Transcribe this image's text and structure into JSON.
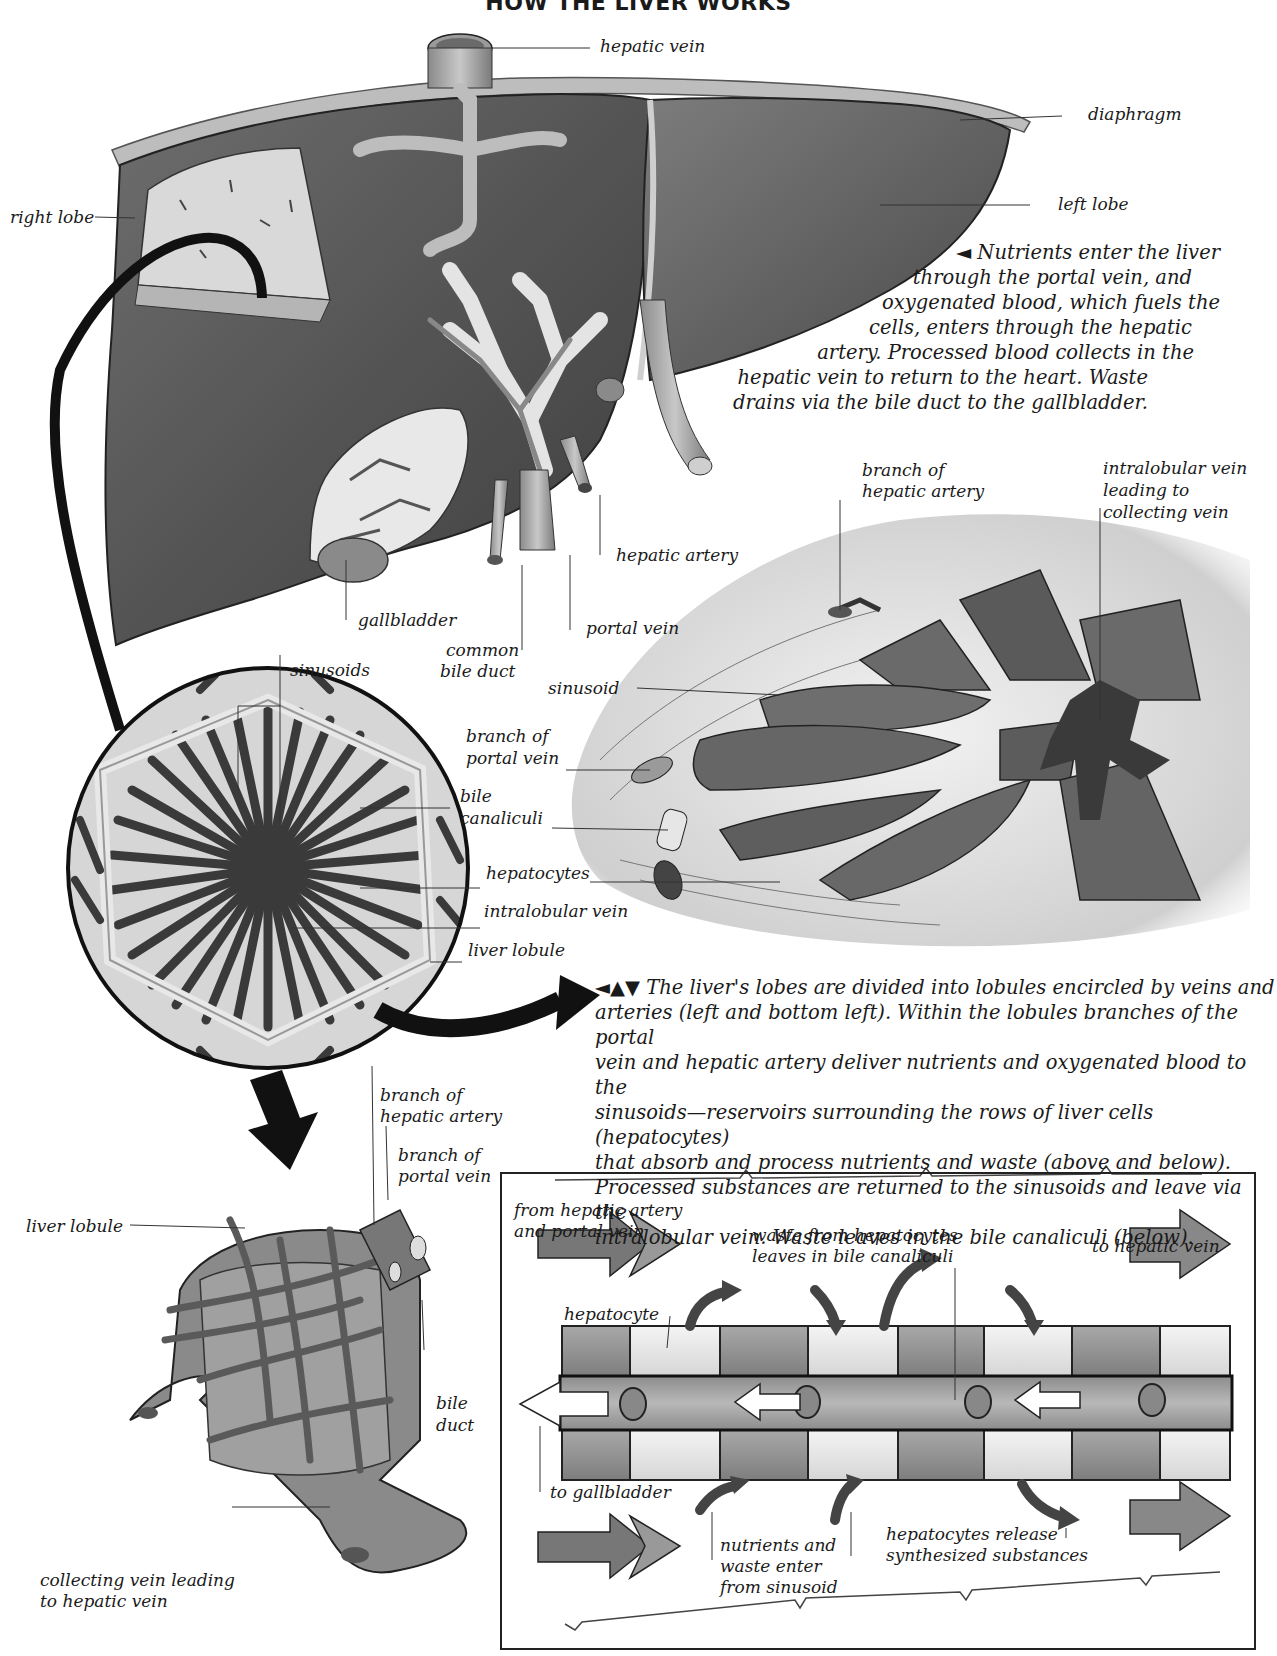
{
  "title": "HOW THE LIVER WORKS",
  "liver_labels": {
    "hepatic_vein": "hepatic vein",
    "diaphragm": "diaphragm",
    "right_lobe": "right lobe",
    "left_lobe": "left lobe",
    "gallbladder": "gallbladder",
    "common_bile_duct_1": "common",
    "common_bile_duct_2": "bile duct",
    "portal_vein": "portal vein",
    "hepatic_artery": "hepatic artery"
  },
  "caption_top": {
    "arrow": "◄",
    "lines": [
      "Nutrients enter the liver",
      "through the portal vein, and",
      "oxygenated blood, which fuels the",
      "cells, enters through the hepatic",
      "artery. Processed blood collects in the",
      "hepatic vein to return to the heart. Waste",
      "drains via the bile duct to the gallbladder."
    ]
  },
  "lobule_section_labels": {
    "branch_hepatic_artery_1": "branch of",
    "branch_hepatic_artery_2": "hepatic artery",
    "intralobular_vein_1": "intralobular vein",
    "intralobular_vein_2": "leading to",
    "intralobular_vein_3": "collecting vein",
    "sinusoid": "sinusoid",
    "branch_portal_vein_1": "branch of",
    "branch_portal_vein_2": "portal vein",
    "bile_canaliculi_1": "bile",
    "bile_canaliculi_2": "canaliculi",
    "hepatocytes": "hepatocytes",
    "intralobular_vein": "intralobular vein",
    "liver_lobule": "liver lobule",
    "sinusoids": "sinusoids"
  },
  "caption_middle": {
    "arrows": "◄▲▼",
    "lines": [
      "The liver's lobes are divided into lobules encircled by veins and",
      "arteries (left and bottom left). Within the lobules branches of the portal",
      "vein and hepatic artery deliver nutrients and oxygenated blood to the",
      "sinusoids—reservoirs surrounding the rows of liver cells (hepatocytes)",
      "that absorb and process nutrients and waste (above and below).",
      "Processed substances are returned to the sinusoids and leave via the",
      "intralobular vein. Waste leaves in the bile canaliculi (below)."
    ]
  },
  "lobule_3d_labels": {
    "branch_hepatic_artery_1": "branch of",
    "branch_hepatic_artery_2": "hepatic artery",
    "branch_portal_vein_1": "branch of",
    "branch_portal_vein_2": "portal vein",
    "liver_lobule": "liver lobule",
    "bile_duct_1": "bile",
    "bile_duct_2": "duct",
    "collecting_vein_1": "collecting vein leading",
    "collecting_vein_2": "to hepatic vein"
  },
  "flow_diagram_labels": {
    "from_1": "from hepatic artery",
    "from_2": "and portal vein",
    "waste_1": "waste from hepatocytes",
    "waste_2": "leaves in bile canaliculi",
    "to_hepatic_vein": "to hepatic vein",
    "hepatocyte": "hepatocyte",
    "to_gallbladder": "to gallbladder",
    "nutrients_1": "nutrients and",
    "nutrients_2": "waste enter",
    "nutrients_3": "from sinusoid",
    "release_1": "hepatocytes release",
    "release_2": "synthesized substances"
  },
  "colors": {
    "liver_dark": "#5a5a5a",
    "liver_mid": "#7a7a7a",
    "vessel_light": "#d8d8d8",
    "cell_light": "#e6e6e6",
    "cell_dark": "#9a9a9a",
    "ink": "#1a1a1a"
  }
}
